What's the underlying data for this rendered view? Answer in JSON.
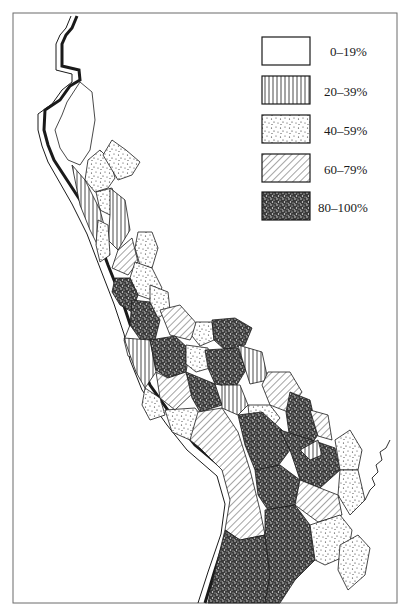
{
  "map": {
    "subject": "coastal administrative districts shaded by percentage class",
    "legend": {
      "items": [
        {
          "id": "c0",
          "label": "0–19%",
          "pattern": "blank"
        },
        {
          "id": "c1",
          "label": "20–39%",
          "pattern": "vertical-lines"
        },
        {
          "id": "c2",
          "label": "40–59%",
          "pattern": "sparse-dots"
        },
        {
          "id": "c3",
          "label": "60–79%",
          "pattern": "diagonal-lines"
        },
        {
          "id": "c4",
          "label": "80–100%",
          "pattern": "dense-stipple"
        }
      ]
    },
    "colors": {
      "ink": "#1a1a1a",
      "paper": "#ffffff",
      "frame": "#6b6b6b"
    }
  }
}
